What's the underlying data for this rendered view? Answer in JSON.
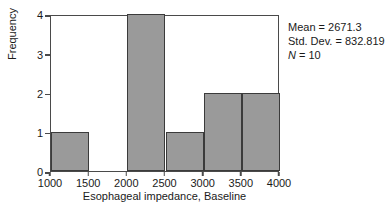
{
  "chart_data": {
    "type": "bar",
    "title": "",
    "xlabel": "Esophageal impedance, Baseline",
    "ylabel": "Frequency",
    "categories": [
      "1000-1500",
      "1500-2000",
      "2000-2500",
      "2500-3000",
      "3000-3500",
      "3500-4000"
    ],
    "bin_starts": [
      1000,
      1500,
      2000,
      2500,
      3000,
      3500
    ],
    "bin_width": 500,
    "values": [
      1,
      0,
      4,
      1,
      2,
      2
    ],
    "xlim": [
      1000,
      4000
    ],
    "ylim": [
      0,
      4
    ],
    "xticks": [
      1000,
      1500,
      2000,
      2500,
      3000,
      3500,
      4000
    ],
    "xtick_labels": [
      "1000",
      "1500",
      "2000",
      "2500",
      "3000",
      "3500",
      "4000"
    ],
    "yticks": [
      0,
      1,
      2,
      3,
      4
    ],
    "ytick_labels": [
      "0",
      "1",
      "2",
      "3",
      "4"
    ],
    "grid": false,
    "legend": null,
    "bar_fill_color": "#9a9a9a",
    "bar_edge_color": "#3b3b3b",
    "frame_color": "#4a4a4a",
    "background_color": "#ffffff"
  },
  "annotations": {
    "mean_label": "Mean = 2671.3",
    "stddev_label": "Std. Dev. = 832.819",
    "n_symbol": "N",
    "n_value": " = 10"
  }
}
